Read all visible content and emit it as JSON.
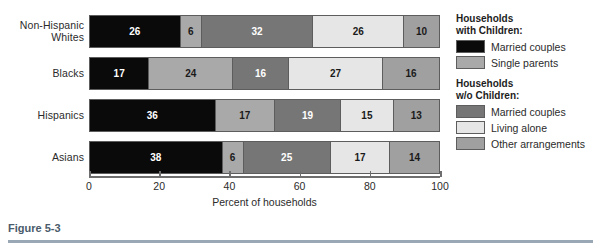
{
  "chart_data": {
    "type": "bar",
    "orientation": "horizontal",
    "stacked": true,
    "title": "",
    "xlabel": "Percent of households",
    "ylabel": "",
    "xlim": [
      0,
      100
    ],
    "xticks": [
      0,
      20,
      40,
      60,
      80,
      100
    ],
    "xtick_labels": [
      "0",
      "20",
      "40",
      "60",
      "80",
      "100"
    ],
    "grid": false,
    "legend_position": "right",
    "categories": [
      "Non-Hispanic Whites",
      "Blacks",
      "Hispanics",
      "Asians"
    ],
    "series": [
      {
        "name": "Married couples",
        "group": "Households with Children:",
        "color": "#0a0a0a",
        "text_color": "#ffffff",
        "values": [
          26,
          17,
          36,
          38
        ]
      },
      {
        "name": "Single parents",
        "group": "Households with Children:",
        "color": "#a9a9a9",
        "text_color": "#1a1a1a",
        "values": [
          6,
          24,
          17,
          6
        ]
      },
      {
        "name": "Married couples",
        "group": "Households w/o Children:",
        "color": "#767676",
        "text_color": "#ffffff",
        "values": [
          32,
          16,
          19,
          25
        ]
      },
      {
        "name": "Living alone",
        "group": "Households w/o Children:",
        "color": "#e6e6e6",
        "text_color": "#1a1a1a",
        "values": [
          26,
          27,
          15,
          17
        ]
      },
      {
        "name": "Other arrangements",
        "group": "Households w/o Children:",
        "color": "#a0a0a0",
        "text_color": "#1a1a1a",
        "values": [
          10,
          16,
          13,
          14
        ]
      }
    ]
  },
  "rows": [
    {
      "label_line1": "Non-Hispanic",
      "label_line2": "Whites",
      "segments": [
        {
          "value": 26,
          "label": "26",
          "color": "#0a0a0a",
          "text_color": "#ffffff"
        },
        {
          "value": 6,
          "label": "6",
          "color": "#a9a9a9",
          "text_color": "#1a1a1a"
        },
        {
          "value": 32,
          "label": "32",
          "color": "#767676",
          "text_color": "#ffffff"
        },
        {
          "value": 26,
          "label": "26",
          "color": "#e6e6e6",
          "text_color": "#1a1a1a"
        },
        {
          "value": 10,
          "label": "10",
          "color": "#a0a0a0",
          "text_color": "#1a1a1a"
        }
      ]
    },
    {
      "label_line1": "Blacks",
      "label_line2": "",
      "segments": [
        {
          "value": 17,
          "label": "17",
          "color": "#0a0a0a",
          "text_color": "#ffffff"
        },
        {
          "value": 24,
          "label": "24",
          "color": "#a9a9a9",
          "text_color": "#1a1a1a"
        },
        {
          "value": 16,
          "label": "16",
          "color": "#767676",
          "text_color": "#ffffff"
        },
        {
          "value": 27,
          "label": "27",
          "color": "#e6e6e6",
          "text_color": "#1a1a1a"
        },
        {
          "value": 16,
          "label": "16",
          "color": "#a0a0a0",
          "text_color": "#1a1a1a"
        }
      ]
    },
    {
      "label_line1": "Hispanics",
      "label_line2": "",
      "segments": [
        {
          "value": 36,
          "label": "36",
          "color": "#0a0a0a",
          "text_color": "#ffffff"
        },
        {
          "value": 17,
          "label": "17",
          "color": "#a9a9a9",
          "text_color": "#1a1a1a"
        },
        {
          "value": 19,
          "label": "19",
          "color": "#767676",
          "text_color": "#ffffff"
        },
        {
          "value": 15,
          "label": "15",
          "color": "#e6e6e6",
          "text_color": "#1a1a1a"
        },
        {
          "value": 13,
          "label": "13",
          "color": "#a0a0a0",
          "text_color": "#1a1a1a"
        }
      ]
    },
    {
      "label_line1": "Asians",
      "label_line2": "",
      "segments": [
        {
          "value": 38,
          "label": "38",
          "color": "#0a0a0a",
          "text_color": "#ffffff"
        },
        {
          "value": 6,
          "label": "6",
          "color": "#a9a9a9",
          "text_color": "#1a1a1a"
        },
        {
          "value": 25,
          "label": "25",
          "color": "#767676",
          "text_color": "#ffffff"
        },
        {
          "value": 17,
          "label": "17",
          "color": "#e6e6e6",
          "text_color": "#1a1a1a"
        },
        {
          "value": 14,
          "label": "14",
          "color": "#a0a0a0",
          "text_color": "#1a1a1a"
        }
      ]
    }
  ],
  "axis": {
    "title": "Percent of households",
    "ticks": [
      "0",
      "20",
      "40",
      "60",
      "80",
      "100"
    ]
  },
  "legend": {
    "groups": [
      {
        "title_line1": "Households",
        "title_line2": "with Children:",
        "items": [
          {
            "label": "Married couples",
            "color": "#0a0a0a"
          },
          {
            "label": "Single parents",
            "color": "#a9a9a9"
          }
        ]
      },
      {
        "title_line1": "Households",
        "title_line2": "w/o Children:",
        "items": [
          {
            "label": "Married couples",
            "color": "#767676"
          },
          {
            "label": "Living alone",
            "color": "#e6e6e6"
          },
          {
            "label": "Other arrangements",
            "color": "#a0a0a0"
          }
        ]
      }
    ]
  },
  "caption": {
    "text": "Figure 5-3"
  }
}
